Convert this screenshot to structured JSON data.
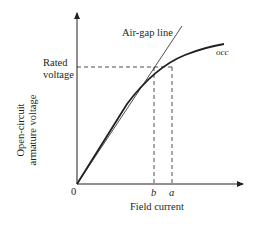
{
  "diagram": {
    "type": "open-circuit characteristic of synchronous generator",
    "y_axis_label_line1": "Open-circuit",
    "y_axis_label_line2": "armature voltage",
    "x_axis_label": "Field current",
    "origin_label": "0",
    "rated_voltage_line1": "Rated",
    "rated_voltage_line2": "voltage",
    "airgap_label": "Air-gap line",
    "occ_label": "occ",
    "tick_b": "b",
    "tick_a": "a",
    "colors": {
      "ink": "#231f20",
      "background": "#ffffff"
    }
  }
}
